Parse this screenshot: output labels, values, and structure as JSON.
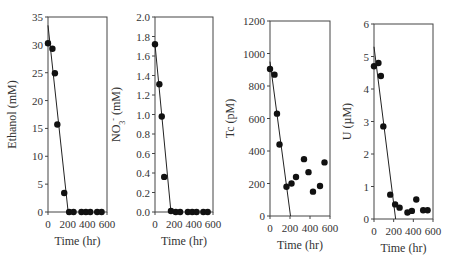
{
  "chart_data": [
    {
      "type": "scatter",
      "title": "",
      "xlabel": "Time (hr)",
      "ylabel": "Ethanol (mM)",
      "xlim": [
        0,
        600
      ],
      "ylim": [
        0,
        35
      ],
      "xticks": [
        "0",
        "200",
        "400",
        "600"
      ],
      "yticks": [
        "0",
        "5",
        "10",
        "15",
        "20",
        "25",
        "30",
        "35"
      ],
      "points": {
        "x": [
          0,
          45,
          70,
          95,
          165,
          215,
          260,
          340,
          385,
          430,
          500,
          545
        ],
        "y": [
          30.3,
          29.3,
          24.9,
          15.7,
          3.4,
          0,
          0,
          0,
          0,
          0,
          0,
          0
        ]
      },
      "fit_line": {
        "x": [
          0,
          205
        ],
        "y": [
          33.5,
          0
        ]
      },
      "grid": false
    },
    {
      "type": "scatter",
      "title": "",
      "xlabel": "Time (hr)",
      "ylabel": "NO3- (mM)",
      "xlim": [
        0,
        600
      ],
      "ylim": [
        0,
        2.0
      ],
      "xticks": [
        "0",
        "200",
        "400",
        "600"
      ],
      "yticks": [
        "0.0",
        "0.2",
        "0.4",
        "0.6",
        "0.8",
        "1.0",
        "1.2",
        "1.4",
        "1.6",
        "1.8",
        "2.0"
      ],
      "points": {
        "x": [
          0,
          45,
          70,
          95,
          165,
          215,
          260,
          340,
          385,
          430,
          500,
          545
        ],
        "y": [
          1.72,
          1.31,
          0.98,
          0.36,
          0.01,
          0,
          0,
          0,
          0,
          0,
          0,
          0
        ]
      },
      "fit_line": {
        "x": [
          0,
          165
        ],
        "y": [
          1.72,
          0
        ]
      },
      "grid": false
    },
    {
      "type": "scatter",
      "title": "",
      "xlabel": "Time (hr)",
      "ylabel": "Tc (pM)",
      "xlim": [
        0,
        600
      ],
      "ylim": [
        0,
        1200
      ],
      "xticks": [
        "0",
        "200",
        "400",
        "600"
      ],
      "yticks": [
        "0",
        "200",
        "400",
        "600",
        "800",
        "1000",
        "1200"
      ],
      "points": {
        "x": [
          0,
          45,
          70,
          95,
          165,
          215,
          260,
          340,
          385,
          430,
          500,
          545
        ],
        "y": [
          905,
          870,
          630,
          440,
          180,
          200,
          240,
          350,
          270,
          150,
          185,
          330
        ]
      },
      "fit_line": {
        "x": [
          0,
          205
        ],
        "y": [
          950,
          0
        ]
      },
      "grid": false
    },
    {
      "type": "scatter",
      "title": "",
      "xlabel": "Time (hr)",
      "ylabel": "U (µM)",
      "xlim": [
        0,
        600
      ],
      "ylim": [
        0,
        6
      ],
      "xticks": [
        "0",
        "200",
        "400",
        "600"
      ],
      "yticks": [
        "0",
        "1",
        "2",
        "3",
        "4",
        "5",
        "6"
      ],
      "points": {
        "x": [
          0,
          45,
          70,
          95,
          165,
          215,
          260,
          340,
          385,
          430,
          500,
          545
        ],
        "y": [
          4.7,
          4.8,
          4.4,
          2.85,
          0.75,
          0.45,
          0.35,
          0.2,
          0.25,
          0.6,
          0.27,
          0.27
        ]
      },
      "fit_line": {
        "x": [
          0,
          220
        ],
        "y": [
          5.3,
          0
        ]
      },
      "grid": false
    }
  ]
}
